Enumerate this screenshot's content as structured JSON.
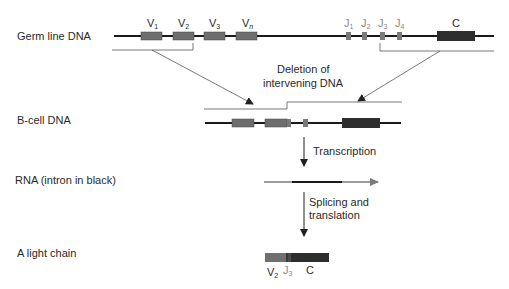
{
  "row_labels": {
    "germline": "Germ line DNA",
    "bcell": "B-cell DNA",
    "rna": "RNA (intron in black)",
    "light_chain": "A light chain"
  },
  "segments": {
    "v1": {
      "base": "V",
      "sub": "1"
    },
    "v2": {
      "base": "V",
      "sub": "2"
    },
    "v3": {
      "base": "V",
      "sub": "3"
    },
    "vn": {
      "base": "V",
      "sub": "n"
    },
    "j1": {
      "base": "J",
      "sub": "1"
    },
    "j2": {
      "base": "J",
      "sub": "2"
    },
    "j3": {
      "base": "J",
      "sub": "3"
    },
    "j4": {
      "base": "J",
      "sub": "4"
    },
    "c": "C"
  },
  "annotations": {
    "deletion_line1": "Deletion of",
    "deletion_line2": "intervening DNA",
    "transcription": "Transcription",
    "splicing_line1": "Splicing and",
    "splicing_line2": "translation"
  },
  "light_chain_labels": {
    "v": {
      "base": "V",
      "sub": "2"
    },
    "j": {
      "base": "J",
      "sub": "3"
    },
    "c": "C"
  },
  "colors": {
    "v_segment": "#6e6e6e",
    "j_segment": "#7a7a7a",
    "c_segment": "#2e2e2e",
    "dna_line": "#1a1a1a",
    "rna_line": "#7a7a7a"
  }
}
